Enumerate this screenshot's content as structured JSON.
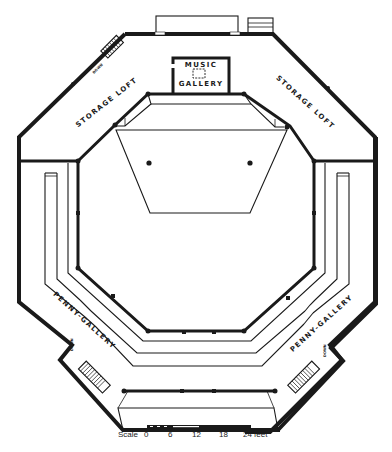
{
  "plan": {
    "labels": {
      "storage_loft_left": "STORAGE LOFT",
      "storage_loft_right": "STORAGE LOFT",
      "music_gallery_line1": "MUSIC",
      "music_gallery_line2": "GALLERY",
      "penny_gallery_left": "PENNY-GALLERY",
      "penny_gallery_right": "PENNY-GALLERY",
      "stair_left_top": "DOWN",
      "stair_left_bottom": "DOWN",
      "stair_right_bottom": "DOWN"
    },
    "scale": {
      "label": "Scale",
      "ticks": [
        "0",
        "6",
        "12",
        "18",
        "24 feet"
      ]
    }
  }
}
